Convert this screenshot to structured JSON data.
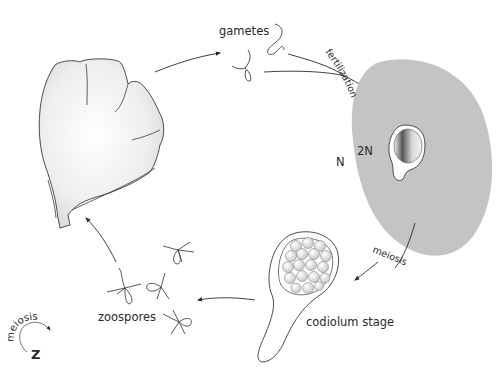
{
  "diagram": {
    "type": "life-cycle",
    "colors": {
      "zygote_fill": "#c4c4c4",
      "thallus_fill": "#f0f0f0",
      "line": "#3a3a3a",
      "text": "#2a2a2a"
    },
    "labels": {
      "gametes": "gametes",
      "fertilization": "fertilization",
      "diploid": "2N",
      "haploid": "N",
      "meiosis_right": "meiosis",
      "codiolum": "codiolum stage",
      "zoospores": "zoospores",
      "legend_meiosis": "meiosis",
      "legend_z": "Z"
    },
    "stages": [
      {
        "id": "thallus",
        "name": "gametophyte thallus (fan-shaped blade)"
      },
      {
        "id": "gametes",
        "name": "gametes"
      },
      {
        "id": "zygote",
        "name": "zygote (2N) in gray cell"
      },
      {
        "id": "codiolum",
        "name": "codiolum stage"
      },
      {
        "id": "zoospores",
        "name": "zoospores"
      }
    ],
    "arrows": [
      {
        "from": "thallus",
        "to": "gametes"
      },
      {
        "from": "gametes",
        "to": "zygote",
        "label": "fertilization"
      },
      {
        "from": "zygote",
        "to": "codiolum",
        "label": "meiosis"
      },
      {
        "from": "codiolum",
        "to": "zoospores"
      },
      {
        "from": "zoospores",
        "to": "thallus"
      }
    ]
  }
}
